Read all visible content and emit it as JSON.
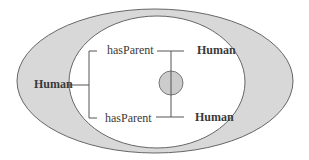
{
  "diagram": {
    "type": "description-logic-tree",
    "colors": {
      "outer_fill": "#d8d8d8",
      "inner_fill": "#ffffff",
      "stroke": "#555555",
      "circle_fill": "#cccccc",
      "text": "#3a3a3a"
    },
    "root": {
      "label": "Human"
    },
    "branches": [
      {
        "role": "hasParent",
        "filler": "Human"
      },
      {
        "role": "hasParent",
        "filler": "Human"
      }
    ],
    "join_marker": "circle"
  }
}
